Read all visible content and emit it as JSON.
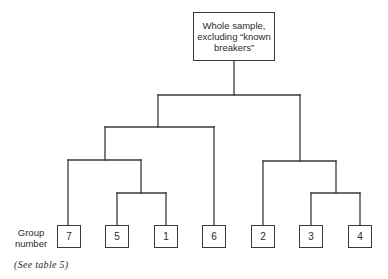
{
  "diagram": {
    "type": "dendrogram",
    "root": {
      "label_lines": [
        "Whole sample,",
        "excluding “known",
        "breakers”"
      ],
      "label": "Whole sample, excluding “known breakers”"
    },
    "leaf_axis_label_lines": [
      "Group",
      "number"
    ],
    "leaf_axis_label": "Group number",
    "leaves": [
      {
        "label": "7",
        "x": 57
      },
      {
        "label": "5",
        "x": 105
      },
      {
        "label": "1",
        "x": 154
      },
      {
        "label": "6",
        "x": 202
      },
      {
        "label": "2",
        "x": 252
      },
      {
        "label": "3",
        "x": 300
      },
      {
        "label": "4",
        "x": 348
      }
    ],
    "tree": {
      "children": [
        {
          "children": [
            {
              "children": [
                "7",
                {
                  "children": [
                    "5",
                    "1"
                  ]
                }
              ]
            },
            "6"
          ]
        },
        {
          "children": [
            "2",
            {
              "children": [
                "3",
                "4"
              ]
            }
          ]
        }
      ]
    },
    "note": "(See table 5)",
    "line_color": "#3a3a3a"
  }
}
